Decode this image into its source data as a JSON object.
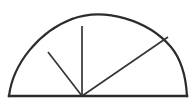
{
  "figure": {
    "canvas": {
      "width": 195,
      "height": 109,
      "background_color": "#ffffff"
    },
    "style": {
      "line_color": "#2b2b30",
      "thin_line_color": "#35353a",
      "baseline_width": 2.2,
      "arc_width": 2.2,
      "radius_width": 1.6
    },
    "points": {
      "baseline_left": {
        "label": "A",
        "x": 9,
        "y": 96
      },
      "baseline_right": {
        "label": "B",
        "x": 187,
        "y": 96
      },
      "vertex": {
        "label": "O",
        "x": 82,
        "y": 96
      },
      "arc_apex": {
        "label": "T",
        "x": 125,
        "y": 13
      },
      "arc_point_upper_left": {
        "label": "C",
        "x": 48,
        "y": 52
      },
      "arc_point_top": {
        "label": "D",
        "x": 82,
        "y": 26
      },
      "arc_point_upper_right": {
        "label": "E",
        "x": 168,
        "y": 37
      }
    },
    "segments": [
      {
        "name": "baseline",
        "from": "A",
        "to": "B",
        "kind": "straight"
      },
      {
        "name": "arc",
        "from": "A",
        "to": "B",
        "kind": "arc",
        "apex": "T"
      },
      {
        "name": "radius-upper-left",
        "from": "O",
        "to": "C",
        "kind": "straight"
      },
      {
        "name": "radius-vertical",
        "from": "O",
        "to": "D",
        "kind": "straight"
      },
      {
        "name": "radius-upper-right",
        "from": "O",
        "to": "E",
        "kind": "straight"
      }
    ],
    "paths": {
      "baseline": "M 9 96 L 187 96",
      "arc_left_half": "M 9 96 C 13 63 40 31 72 19",
      "arc_right_half": "M 72 19 C 104 7 148 20 171 47 C 181 59 186 78 187 96",
      "radius_upper_left": "M 82 96 L 48 52",
      "radius_vertical": "M 82 96 L 82 26",
      "radius_upper_right": "M 82 96 L 168 37"
    },
    "labels": {
      "baseline": "baseline",
      "arc": "arc",
      "vertex": "vertex",
      "radius_1": "radius to upper-left arc",
      "radius_2": "vertical radius",
      "radius_3": "radius to upper-right arc"
    }
  }
}
